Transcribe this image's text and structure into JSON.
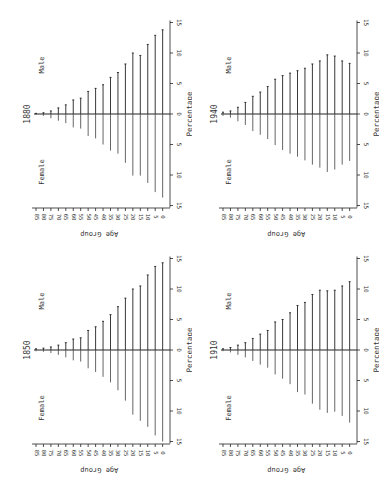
{
  "figure": {
    "orientation": "rotated 90 degrees clockwise",
    "colors": {
      "ink": "#222222",
      "background": "#ffffff"
    }
  },
  "chart_data": [
    {
      "type": "bar",
      "subtype": "population-pyramid",
      "title": "1880",
      "xlabel": "Age Group",
      "ylabel": "Percentage",
      "categories": [
        "85",
        "80",
        "75",
        "70",
        "65",
        "60",
        "55",
        "50",
        "45",
        "40",
        "35",
        "30",
        "25",
        "20",
        "15",
        "10",
        "5",
        "0"
      ],
      "series": [
        {
          "name": "Male",
          "values": [
            0.1,
            0.2,
            0.5,
            1.0,
            1.5,
            2.3,
            2.6,
            3.7,
            4.2,
            4.8,
            6.0,
            6.8,
            8.2,
            10.0,
            9.6,
            11.4,
            12.9,
            13.8
          ]
        },
        {
          "name": "Female",
          "values": [
            0.1,
            0.3,
            0.7,
            1.1,
            1.5,
            2.2,
            2.4,
            3.6,
            4.0,
            5.0,
            6.0,
            6.5,
            8.0,
            10.1,
            10.1,
            11.3,
            12.8,
            13.7
          ]
        }
      ],
      "ylim": [
        -15,
        15
      ],
      "yticks": [
        "15",
        "10",
        "5",
        "0",
        "5",
        "10",
        "15"
      ],
      "position": {
        "x": 0,
        "y": 0
      }
    },
    {
      "type": "bar",
      "subtype": "population-pyramid",
      "title": "1940",
      "xlabel": "Age Group",
      "ylabel": "Percentage",
      "categories": [
        "85",
        "80",
        "75",
        "70",
        "65",
        "60",
        "55",
        "50",
        "45",
        "40",
        "35",
        "30",
        "25",
        "20",
        "15",
        "10",
        "5",
        "0"
      ],
      "series": [
        {
          "name": "Male",
          "values": [
            0.3,
            0.5,
            1.1,
            1.9,
            2.9,
            3.6,
            4.5,
            5.7,
            6.3,
            6.7,
            7.1,
            7.5,
            8.2,
            8.7,
            9.7,
            9.5,
            8.7,
            8.3
          ]
        },
        {
          "name": "Female",
          "values": [
            0.3,
            0.6,
            1.2,
            1.8,
            2.8,
            3.4,
            4.1,
            5.1,
            5.9,
            6.5,
            7.0,
            7.6,
            8.3,
            8.8,
            9.5,
            9.1,
            8.3,
            7.7
          ]
        }
      ],
      "ylim": [
        -15,
        15
      ],
      "yticks": [
        "15",
        "10",
        "5",
        "0",
        "5",
        "10",
        "15"
      ],
      "position": {
        "x": 187,
        "y": 0
      }
    },
    {
      "type": "bar",
      "subtype": "population-pyramid",
      "title": "1850",
      "xlabel": "Age Group",
      "ylabel": "Percentage",
      "categories": [
        "85",
        "80",
        "75",
        "70",
        "65",
        "60",
        "55",
        "50",
        "45",
        "40",
        "35",
        "30",
        "25",
        "20",
        "15",
        "10",
        "5",
        "0"
      ],
      "series": [
        {
          "name": "Male",
          "values": [
            0.2,
            0.3,
            0.5,
            0.8,
            1.2,
            1.8,
            2.0,
            3.2,
            3.8,
            4.7,
            5.8,
            7.1,
            8.5,
            10.0,
            10.5,
            12.3,
            13.7,
            14.3
          ]
        },
        {
          "name": "Female",
          "values": [
            0.2,
            0.3,
            0.5,
            0.8,
            1.2,
            1.7,
            1.9,
            3.0,
            3.6,
            4.4,
            5.3,
            6.6,
            8.3,
            10.6,
            11.6,
            12.6,
            14.0,
            15.0
          ]
        }
      ],
      "ylim": [
        -15,
        15
      ],
      "yticks": [
        "15",
        "10",
        "5",
        "0",
        "5",
        "10",
        "15"
      ],
      "position": {
        "x": 0,
        "y": 236
      }
    },
    {
      "type": "bar",
      "subtype": "population-pyramid",
      "title": "1910",
      "xlabel": "Age Group",
      "ylabel": "Percentage",
      "categories": [
        "85",
        "80",
        "75",
        "70",
        "65",
        "60",
        "55",
        "50",
        "45",
        "40",
        "35",
        "30",
        "25",
        "20",
        "15",
        "10",
        "5",
        "0"
      ],
      "series": [
        {
          "name": "Male",
          "values": [
            0.2,
            0.4,
            0.8,
            1.2,
            1.9,
            2.6,
            3.2,
            4.6,
            5.0,
            6.1,
            7.3,
            7.8,
            9.1,
            9.8,
            9.7,
            9.8,
            10.5,
            11.2
          ]
        },
        {
          "name": "Female",
          "values": [
            0.2,
            0.4,
            0.8,
            1.2,
            1.8,
            2.4,
            2.9,
            4.0,
            4.7,
            5.6,
            6.9,
            7.3,
            8.8,
            9.8,
            10.3,
            10.1,
            10.8,
            11.9
          ]
        }
      ],
      "ylim": [
        -15,
        15
      ],
      "yticks": [
        "15",
        "10",
        "5",
        "0",
        "5",
        "10",
        "15"
      ],
      "position": {
        "x": 187,
        "y": 236
      }
    }
  ]
}
